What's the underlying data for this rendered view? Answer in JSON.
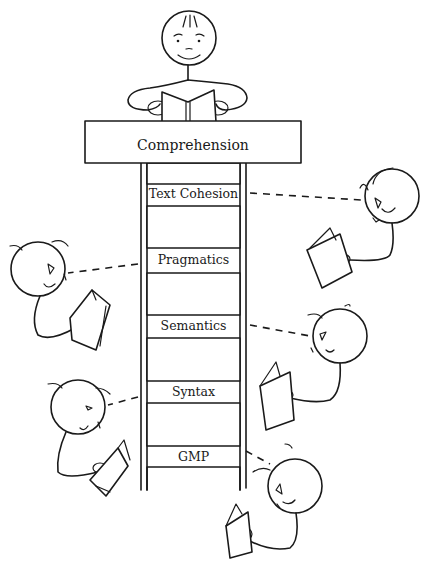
{
  "diagram": {
    "type": "ladder-illustration",
    "top_box": {
      "label": "Comprehension"
    },
    "rungs": [
      {
        "label": "Text Cohesion"
      },
      {
        "label": "Pragmatics"
      },
      {
        "label": "Semantics"
      },
      {
        "label": "Syntax"
      },
      {
        "label": "GMP"
      }
    ],
    "figures": [
      {
        "role": "reader-on-top",
        "position": "top-center",
        "connected_to": "Comprehension"
      },
      {
        "role": "reader",
        "position": "right",
        "connected_to": "Text Cohesion"
      },
      {
        "role": "reader",
        "position": "left",
        "connected_to": "Pragmatics"
      },
      {
        "role": "reader",
        "position": "right",
        "connected_to": "Semantics"
      },
      {
        "role": "reader",
        "position": "left",
        "connected_to": "Syntax"
      },
      {
        "role": "reader",
        "position": "right",
        "connected_to": "GMP"
      }
    ],
    "colors": {
      "ink": "#1a1a1a",
      "background": "#ffffff"
    }
  }
}
